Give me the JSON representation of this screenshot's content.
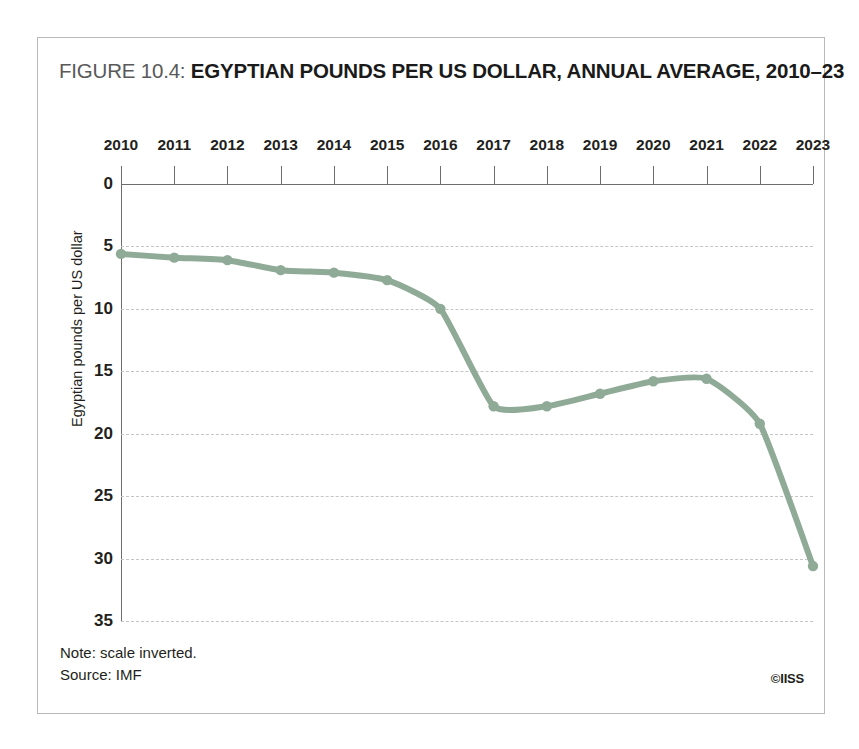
{
  "figure": {
    "label": "FIGURE 10.4:",
    "name": "EGYPTIAN POUNDS PER US DOLLAR, ANNUAL AVERAGE, 2010–23"
  },
  "footer": {
    "note": "Note: scale inverted.",
    "source": "Source: IMF",
    "copyright": "©IISS"
  },
  "style": {
    "line_color": "#8faa96",
    "marker_color": "#8faa96",
    "grid_color": "#c5c5c5",
    "axis_color": "#6d6d6d",
    "frame_color": "#b9b9b9",
    "background": "#ffffff",
    "title_label_color": "#595959",
    "title_name_color": "#1a1a1a"
  },
  "chart_data": {
    "type": "line",
    "title": "EGYPTIAN POUNDS PER US DOLLAR, ANNUAL AVERAGE, 2010–23",
    "xlabel": "",
    "ylabel": "Egyptian pounds per US dollar",
    "note": "Note: scale inverted.",
    "source": "Source: IMF",
    "y_inverted": true,
    "grid": true,
    "legend": "none",
    "xlim": [
      2010,
      2023
    ],
    "ylim": [
      0,
      35
    ],
    "y_ticks": [
      0,
      5,
      10,
      15,
      20,
      25,
      30,
      35
    ],
    "y_tick_labels": [
      "0",
      "5",
      "10",
      "15",
      "20",
      "25",
      "30",
      "35"
    ],
    "categories": [
      "2010",
      "2011",
      "2012",
      "2013",
      "2014",
      "2015",
      "2016",
      "2017",
      "2018",
      "2019",
      "2020",
      "2021",
      "2022",
      "2023"
    ],
    "x": [
      2010,
      2011,
      2012,
      2013,
      2014,
      2015,
      2016,
      2017,
      2018,
      2019,
      2020,
      2021,
      2022,
      2023
    ],
    "values": [
      5.6,
      5.9,
      6.1,
      6.9,
      7.1,
      7.7,
      10.0,
      17.8,
      17.8,
      16.8,
      15.8,
      15.6,
      19.2,
      30.6
    ],
    "series": [
      {
        "name": "Egyptian pounds per US dollar",
        "color": "#8faa96",
        "values": [
          5.6,
          5.9,
          6.1,
          6.9,
          7.1,
          7.7,
          10.0,
          17.8,
          17.8,
          16.8,
          15.8,
          15.6,
          19.2,
          30.6
        ]
      }
    ]
  }
}
